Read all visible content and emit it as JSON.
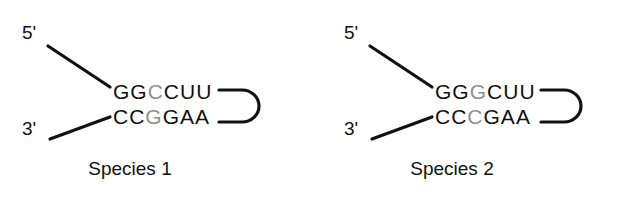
{
  "figure": {
    "background_color": "#ffffff",
    "base_color": "#111111",
    "variant_color": "#8f8f8f",
    "line_color": "#111111"
  },
  "diagrams": [
    {
      "caption": "Species 1",
      "five_prime_label": "5'",
      "three_prime_label": "3'",
      "top_strand": {
        "sequence": "GGCCUU",
        "bases": [
          {
            "letter": "G",
            "variant": false
          },
          {
            "letter": "G",
            "variant": false
          },
          {
            "letter": "C",
            "variant": true
          },
          {
            "letter": "C",
            "variant": false
          },
          {
            "letter": "U",
            "variant": false
          },
          {
            "letter": "U",
            "variant": false
          }
        ]
      },
      "bottom_strand": {
        "sequence": "CCGGAA",
        "bases": [
          {
            "letter": "C",
            "variant": false
          },
          {
            "letter": "C",
            "variant": false
          },
          {
            "letter": "G",
            "variant": true
          },
          {
            "letter": "G",
            "variant": false
          },
          {
            "letter": "A",
            "variant": false
          },
          {
            "letter": "A",
            "variant": false
          }
        ]
      }
    },
    {
      "caption": "Species 2",
      "five_prime_label": "5'",
      "three_prime_label": "3'",
      "top_strand": {
        "sequence": "GGGCUU",
        "bases": [
          {
            "letter": "G",
            "variant": false
          },
          {
            "letter": "G",
            "variant": false
          },
          {
            "letter": "G",
            "variant": true
          },
          {
            "letter": "C",
            "variant": false
          },
          {
            "letter": "U",
            "variant": false
          },
          {
            "letter": "U",
            "variant": false
          }
        ]
      },
      "bottom_strand": {
        "sequence": "CCCGAA",
        "bases": [
          {
            "letter": "C",
            "variant": false
          },
          {
            "letter": "C",
            "variant": false
          },
          {
            "letter": "C",
            "variant": true
          },
          {
            "letter": "G",
            "variant": false
          },
          {
            "letter": "A",
            "variant": false
          },
          {
            "letter": "A",
            "variant": false
          }
        ]
      }
    }
  ]
}
